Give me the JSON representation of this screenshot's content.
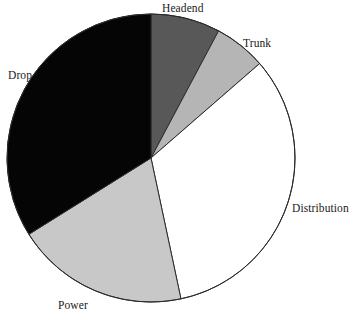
{
  "chart_data": {
    "type": "pie",
    "title": "",
    "subtitle": "",
    "xlabel": "",
    "ylabel": "",
    "legend_position": "none",
    "grid": false,
    "labels_placement": "outside-adjacent-to-slice",
    "start_angle_deg": 0,
    "direction": "clockwise",
    "categories": [
      "Headend",
      "Trunk",
      "Distribution",
      "Power",
      "Drop"
    ],
    "values": [
      7.8,
      5.8,
      33.0,
      19.4,
      34.0
    ],
    "units": "percent",
    "slices": [
      {
        "label": "Headend",
        "value": 7.8,
        "start_angle_deg": 0,
        "end_angle_deg": 28,
        "color": "#585858",
        "label_x": 162,
        "label_y": 3
      },
      {
        "label": "Trunk",
        "value": 5.8,
        "start_angle_deg": 28,
        "end_angle_deg": 49,
        "color": "#b5b5b5",
        "label_x": 243,
        "label_y": 38
      },
      {
        "label": "Distribution",
        "value": 33.0,
        "start_angle_deg": 49,
        "end_angle_deg": 168,
        "color": "#ffffff",
        "label_x": 292,
        "label_y": 203
      },
      {
        "label": "Power",
        "value": 19.4,
        "start_angle_deg": 168,
        "end_angle_deg": 238,
        "color": "#c8c8c8",
        "label_x": 58,
        "label_y": 300
      },
      {
        "label": "Drop",
        "value": 34.0,
        "start_angle_deg": 238,
        "end_angle_deg": 360,
        "color": "#050505",
        "label_x": 8,
        "label_y": 70
      }
    ],
    "geometry": {
      "center_x": 151,
      "center_y": 158,
      "radius": 144,
      "outline_color": "#2b2b2b",
      "outline_width": 1
    }
  },
  "labels": {
    "headend": "Headend",
    "trunk": "Trunk",
    "distribution": "Distribution",
    "power": "Power",
    "drop": "Drop"
  }
}
